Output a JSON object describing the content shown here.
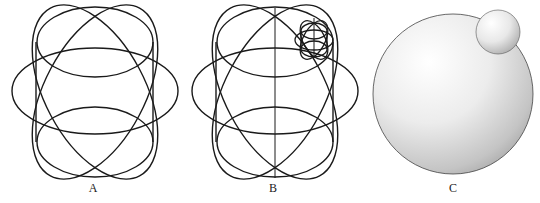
{
  "figure": {
    "panels": [
      {
        "id": "A",
        "label": "A",
        "description": "Wireframe of overlapping ellipses forming a sphere-like shape"
      },
      {
        "id": "B",
        "label": "B",
        "description": "Wireframe sphere with vertical axis and small wireframe sphere attached at upper right"
      },
      {
        "id": "C",
        "label": "C",
        "description": "Shaded large sphere with small shaded sphere attached at upper right"
      }
    ]
  },
  "colors": {
    "stroke": "#1a1a1a",
    "background": "#ffffff",
    "sphere_light": "#ffffff",
    "sphere_dark": "#9a9a9a"
  }
}
